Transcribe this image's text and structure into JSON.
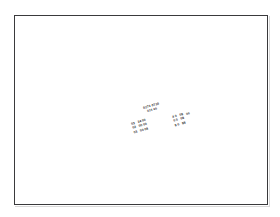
{
  "canvas": {
    "width": 280,
    "height": 217,
    "background_color": "#ffffff"
  },
  "page_frame": {
    "border_color": "#3a3a3c",
    "fill_color": "#ffffff",
    "label": "page-border"
  },
  "content": {
    "rotation_degrees": -16,
    "text_color": "#1b1b1b",
    "header": {
      "line_1": "0273 0730",
      "line_2": "015 00"
    },
    "table": {
      "rows": [
        {
          "label": "03",
          "value": "14 00"
        },
        {
          "label": "02",
          "value": "00 00"
        },
        {
          "label": "03",
          "value": "00 08"
        }
      ]
    },
    "column": {
      "rows": [
        {
          "cell_a": "4 0",
          "cell_b": "08"
        },
        {
          "cell_a": "0 0",
          "cell_b": "08"
        },
        {
          "cell_a": "8 0",
          "cell_b": "88"
        }
      ]
    },
    "mark": "00"
  }
}
